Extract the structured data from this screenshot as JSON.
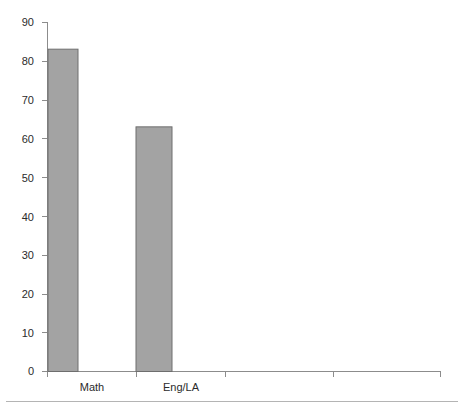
{
  "chart_data": {
    "type": "bar",
    "title": "",
    "subtitle": "",
    "xlabel": "",
    "ylabel": "",
    "categories": [
      "Math",
      "Eng/LA",
      "",
      "",
      ""
    ],
    "values": [
      83,
      63,
      null,
      null,
      null
    ],
    "series": [
      {
        "name": "",
        "values": [
          83,
          63,
          null,
          null,
          null
        ]
      }
    ],
    "ylim": [
      0,
      90
    ],
    "y_ticks": [
      0,
      10,
      20,
      30,
      40,
      50,
      60,
      70,
      80,
      90
    ],
    "y_tick_labels": [
      "0",
      "10",
      "20",
      "30",
      "40",
      "50",
      "60",
      "70",
      "80",
      "90"
    ],
    "x_tick_labels": [
      "Math",
      "Eng/LA"
    ],
    "grid": false,
    "legend": null,
    "legend_position": "none",
    "annotations": [],
    "colors": {
      "bar_fill": "#a3a3a3",
      "bar_stroke": "#6e6e6e",
      "axis": "#8c8c8c",
      "text": "#2b2b2b",
      "background": "#ffffff",
      "divider": "#b4b4b4"
    }
  },
  "axes": {
    "y_labels": [
      {
        "value": "90"
      },
      {
        "value": "80"
      },
      {
        "value": "70"
      },
      {
        "value": "60"
      },
      {
        "value": "50"
      },
      {
        "value": "40"
      },
      {
        "value": "30"
      },
      {
        "value": "20"
      },
      {
        "value": "10"
      },
      {
        "value": "0"
      }
    ],
    "x_labels": [
      {
        "value": "Math"
      },
      {
        "value": "Eng/LA"
      }
    ]
  }
}
